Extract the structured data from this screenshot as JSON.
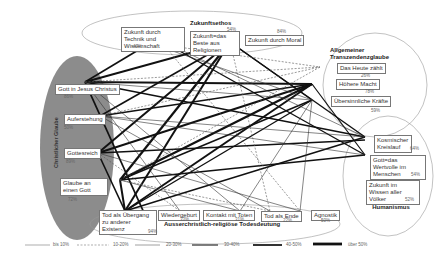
{
  "groups": {
    "christian": {
      "title": "Christlicher Glaube"
    },
    "zukunftsethos": {
      "title": "Zukunftsethos"
    },
    "transzendenz": {
      "title": "Allgemeiner Transzendenzglaube"
    },
    "humanismus": {
      "title": "Religiöser Humanismus"
    },
    "todesdeutung": {
      "title": "Ausserchristlich-religiöse Todesdeutung"
    }
  },
  "nodes": {
    "jesus": {
      "label": "Gott in Jesus Christus",
      "pct": "86%"
    },
    "auferstehung": {
      "label": "Auferstehung",
      "pct": "50%"
    },
    "gottesreich": {
      "label": "Gottesreich",
      "pct": "89%"
    },
    "einengott": {
      "label": "Glaube an einen Gott",
      "pct": "72%"
    },
    "technik": {
      "label": "Zukunft durch Technik und Wissenschaft",
      "pct": "47%"
    },
    "religionen": {
      "label": "Zukunft=das Beste aus Religionen",
      "pct": "54%"
    },
    "moral": {
      "label": "Zukunft durch Moral",
      "pct": "84%"
    },
    "heute": {
      "label": "Das Heute zählt",
      "pct": "26%"
    },
    "macht": {
      "label": "Höhere Macht",
      "pct": "78%"
    },
    "kraefte": {
      "label": "Übersinnliche Kräfte",
      "pct": "59%"
    },
    "kreislauf": {
      "label": "Kosmischer Kreislauf",
      "pct": "64%"
    },
    "wertvolle": {
      "label": "Gott=das Wertvolle im Menschen",
      "pct": "54%"
    },
    "wissen": {
      "label": "Zukunft im Wissen aller Völker",
      "pct": "52%"
    },
    "uebergang": {
      "label": "Tod als Übergang zu anderer Existenz",
      "pct": "94%"
    },
    "wiedergeburt": {
      "label": "Wiedergeburt",
      "pct": "33%"
    },
    "kontakt": {
      "label": "Kontakt mit Toten",
      "pct": "31%"
    },
    "ende": {
      "label": "Tod als Ende",
      "pct": "22%"
    },
    "agnostik": {
      "label": "Agnostik",
      "pct": "50%"
    }
  },
  "legend": [
    {
      "label": "bis 10%",
      "style": "thin"
    },
    {
      "label": "10-20%",
      "style": "dashed"
    },
    {
      "label": "20-30%",
      "style": "thin-gray"
    },
    {
      "label": "30-40%",
      "style": "medium"
    },
    {
      "label": "40-50%",
      "style": "thick"
    },
    {
      "label": "über 50%",
      "style": "thickest"
    }
  ]
}
